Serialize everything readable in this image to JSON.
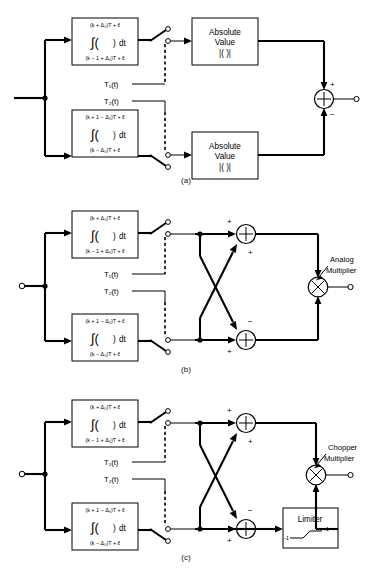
{
  "figure": {
    "title": "",
    "panels": [
      {
        "id": "a",
        "caption": "(a)",
        "integrators": [
          {
            "upper_limit": "(k + Δ₀)T + ɛ̂",
            "body_left": "∫( )",
            "body_right": "dt",
            "lower_limit": "(k − 1 + Δ₀)T + ɛ̂"
          },
          {
            "upper_limit": "(k + 1 − Δ₀)T + ɛ̂",
            "body_left": "∫( )",
            "body_right": "dt",
            "lower_limit": "(k − Δ₀)T + ɛ̂"
          }
        ],
        "switch_labels": [
          "T₁(t)",
          "T₂(t)"
        ],
        "blocks": [
          {
            "line1": "Absolute",
            "line2": "Value",
            "line3": "|( )|"
          },
          {
            "line1": "Absolute",
            "line2": "Value",
            "line3": "|( )|"
          }
        ],
        "summer": {
          "top_sign": "+",
          "bottom_sign": "−"
        }
      },
      {
        "id": "b",
        "caption": "(b)",
        "integrators": [
          {
            "upper_limit": "(k + Δ₀)T + ɛ̂",
            "body_left": "∫( )",
            "body_right": "dt",
            "lower_limit": "(k − 1 + Δ₀)T + ɛ̂"
          },
          {
            "upper_limit": "(k + 1 − Δ₀)T + ɛ̂",
            "body_left": "∫( )",
            "body_right": "dt",
            "lower_limit": "(k − Δ₀)T + ɛ̂"
          }
        ],
        "switch_labels": [
          "T₁(t)",
          "T₂(t)"
        ],
        "summers": [
          {
            "name": "top",
            "straight_sign": "+",
            "cross_sign": "+"
          },
          {
            "name": "bottom",
            "straight_sign": "+",
            "cross_sign": "−"
          }
        ],
        "multiplier": {
          "label_line1": "Analog",
          "label_line2": "Multiplier",
          "symbol": "⊗"
        }
      },
      {
        "id": "c",
        "caption": "(c)",
        "integrators": [
          {
            "upper_limit": "(k + Δ₀)T + ɛ̂",
            "body_left": "∫( )",
            "body_right": "dt",
            "lower_limit": "(k − 1 + Δ₀)T + ɛ̂"
          },
          {
            "upper_limit": "(k + 1 − Δ₀)T + ɛ̂",
            "body_left": "∫( )",
            "body_right": "dt",
            "lower_limit": "(k − Δ₀)T + ɛ̂"
          }
        ],
        "switch_labels": [
          "T₁(t)",
          "T₂(t)"
        ],
        "summers": [
          {
            "name": "top",
            "straight_sign": "+",
            "cross_sign": "+"
          },
          {
            "name": "bottom",
            "straight_sign": "+",
            "cross_sign": "−"
          }
        ],
        "limiter": {
          "label": "Limiter",
          "low": "−1",
          "high": "+1"
        },
        "multiplier": {
          "label_line1": "Chopper",
          "label_line2": "Multiplier",
          "symbol": "⊗"
        }
      }
    ]
  },
  "colors": {
    "ink": "#000000",
    "paper": "#ffffff"
  }
}
